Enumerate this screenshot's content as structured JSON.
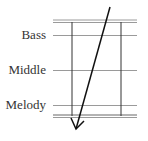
{
  "diagram": {
    "labels": {
      "bass": "Bass",
      "middle": "Middle",
      "melody": "Melody"
    },
    "colors": {
      "staff_line": "#9a9a9a",
      "vertical_line": "#333333",
      "arrow": "#111111",
      "text": "#333333"
    },
    "arrow": {
      "direction": "top-right to bottom-left",
      "from": [
        110,
        7
      ],
      "to": [
        76,
        129
      ]
    }
  }
}
